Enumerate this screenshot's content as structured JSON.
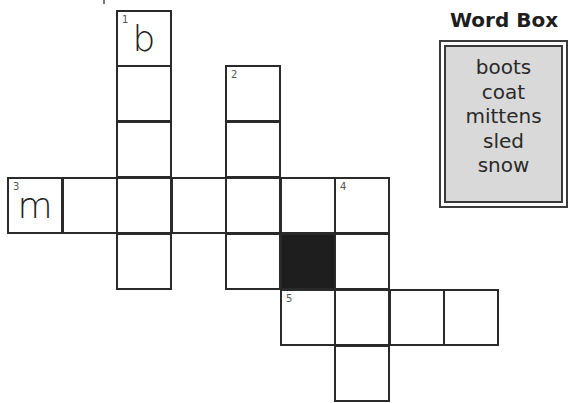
{
  "puzzle": {
    "type": "crossword",
    "cell_size": 55,
    "origin": {
      "x": 7,
      "y": 10
    },
    "cells": [
      {
        "col": 2,
        "row": 0,
        "number": "1",
        "letter": "b"
      },
      {
        "col": 2,
        "row": 1
      },
      {
        "col": 2,
        "row": 2
      },
      {
        "col": 2,
        "row": 3
      },
      {
        "col": 2,
        "row": 4
      },
      {
        "col": 4,
        "row": 1,
        "number": "2"
      },
      {
        "col": 4,
        "row": 2
      },
      {
        "col": 4,
        "row": 3
      },
      {
        "col": 4,
        "row": 4
      },
      {
        "col": 0,
        "row": 3,
        "number": "3",
        "letter": "m"
      },
      {
        "col": 1,
        "row": 3
      },
      {
        "col": 3,
        "row": 3
      },
      {
        "col": 5,
        "row": 3
      },
      {
        "col": 6,
        "row": 3,
        "number": "4"
      },
      {
        "col": 5,
        "row": 4,
        "black": true
      },
      {
        "col": 6,
        "row": 4
      },
      {
        "col": 5,
        "row": 5,
        "number": "5"
      },
      {
        "col": 6,
        "row": 5
      },
      {
        "col": 7,
        "row": 5
      },
      {
        "col": 8,
        "row": 5
      },
      {
        "col": 6,
        "row": 6
      }
    ],
    "colors": {
      "border": "#2a2a2a",
      "black_cell": "#1e1e1e"
    }
  },
  "word_box": {
    "title": "Word Box",
    "words": [
      "boots",
      "coat",
      "mittens",
      "sled",
      "snow"
    ],
    "colors": {
      "background": "#d9d9d9",
      "border": "#3a3a3a"
    }
  }
}
